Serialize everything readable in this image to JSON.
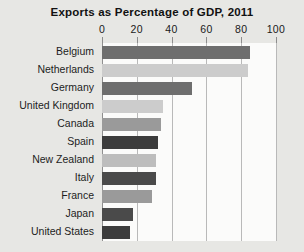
{
  "chart_data": {
    "type": "bar",
    "orientation": "horizontal",
    "title": "Exports as Percentage of GDP, 2011",
    "xlabel": "",
    "ylabel": "",
    "xlim": [
      0,
      100
    ],
    "xticks": [
      0,
      20,
      40,
      60,
      80,
      100
    ],
    "xtick_labels": [
      "0",
      "20",
      "40",
      "60",
      "80",
      "100"
    ],
    "grid": true,
    "legend": "none",
    "categories": [
      "Belgium",
      "Netherlands",
      "Germany",
      "United Kingdom",
      "Canada",
      "Spain",
      "New Zealand",
      "Italy",
      "France",
      "Japan",
      "United States"
    ],
    "values": [
      85,
      84,
      52,
      35,
      34,
      32,
      31,
      31,
      29,
      18,
      16
    ],
    "bar_colors": [
      "#6e6e6e",
      "#cccccc",
      "#6e6e6e",
      "#cccccc",
      "#9a9a9a",
      "#3c3c3c",
      "#bdbdbd",
      "#4a4a4a",
      "#9a9a9a",
      "#4a4a4a",
      "#3c3c3c"
    ]
  },
  "style": {
    "page_background": "#e7e7e4",
    "plot_background": "#fbfbfa",
    "gridline_color": "#b9b9b9",
    "axis_color": "#8f8f8f",
    "text_color": "#1a1a1a"
  }
}
